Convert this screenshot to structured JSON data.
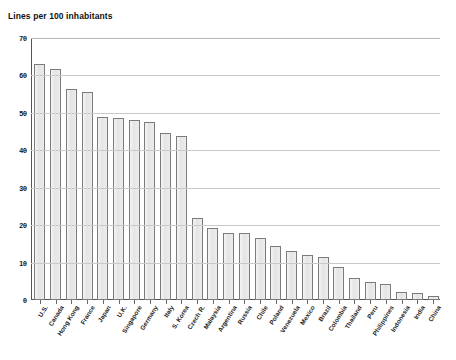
{
  "chart_data": {
    "type": "bar",
    "title": "Lines per 100 inhabitants",
    "xlabel": "",
    "ylabel": "",
    "ylim": [
      0,
      70
    ],
    "yticks": [
      0,
      10,
      20,
      30,
      40,
      50,
      60,
      70
    ],
    "grid": true,
    "legend": "none",
    "bar_fill_color": "#e9e9e9",
    "bar_border_color": "#7b7b7b",
    "categories": [
      "U.S.",
      "Canada",
      "Hong Kong",
      "France",
      "Japan",
      "U.K.",
      "Singapore",
      "Germany",
      "Italy",
      "S. Korea",
      "Czech R.",
      "Malaysia",
      "Argentina",
      "Russia",
      "Chile",
      "Poland",
      "Venezuela",
      "Mexico",
      "Brazil",
      "Colombia",
      "Thailand",
      "Peru",
      "Philippines",
      "Indonesia",
      "India",
      "China"
    ],
    "values": [
      63.0,
      61.8,
      56.3,
      55.5,
      49.0,
      48.5,
      48.0,
      47.5,
      44.5,
      43.8,
      22.0,
      19.2,
      18.0,
      17.8,
      16.5,
      14.5,
      13.0,
      12.0,
      11.5,
      8.8,
      6.0,
      4.8,
      4.2,
      2.2,
      1.8,
      1.2
    ]
  }
}
